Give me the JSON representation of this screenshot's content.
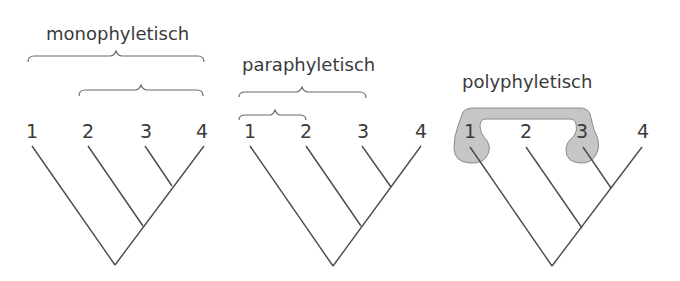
{
  "colors": {
    "line": "#4a4a4a",
    "text": "#3a3a3a",
    "shade_fill": "#c6c6c6",
    "shade_stroke": "#8a8a8a"
  },
  "panels": [
    {
      "title": "monophyletisch",
      "tips": [
        "1",
        "2",
        "3",
        "4"
      ]
    },
    {
      "title": "paraphyletisch",
      "tips": [
        "1",
        "2",
        "3",
        "4"
      ]
    },
    {
      "title": "polyphyletisch",
      "tips": [
        "1",
        "2",
        "3",
        "4"
      ]
    }
  ]
}
